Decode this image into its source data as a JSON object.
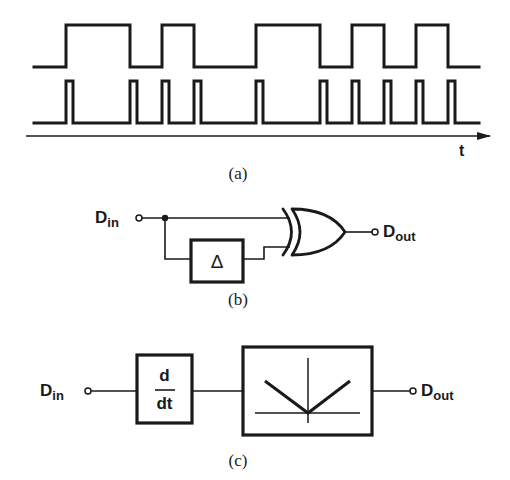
{
  "figure": {
    "part_a": {
      "caption": "(a)",
      "axis_label": "t",
      "waveform_top": {
        "name": "data",
        "low_y": 67,
        "high_y": 25,
        "x_start": 34,
        "x_end": 479,
        "high_intervals": [
          [
            66,
            130
          ],
          [
            162,
            194
          ],
          [
            256,
            320
          ],
          [
            352,
            384
          ],
          [
            416,
            448
          ]
        ]
      },
      "waveform_bottom": {
        "name": "edge-pulses",
        "low_y": 123,
        "high_y": 81,
        "x_start": 34,
        "x_end": 479,
        "pulse_width": 7,
        "pulse_starts": [
          66,
          130,
          162,
          194,
          256,
          320,
          352,
          384,
          416,
          448
        ]
      }
    },
    "part_b": {
      "caption": "(b)",
      "input_label_main": "D",
      "input_label_sub": "in",
      "output_label_main": "D",
      "output_label_sub": "out",
      "delay_symbol": "Δ",
      "gate": "XOR"
    },
    "part_c": {
      "caption": "(c)",
      "input_label_main": "D",
      "input_label_sub": "in",
      "output_label_main": "D",
      "output_label_sub": "out",
      "diff_numerator": "d",
      "diff_denominator": "dt",
      "block": "full-wave rectifier (absolute value)"
    }
  }
}
